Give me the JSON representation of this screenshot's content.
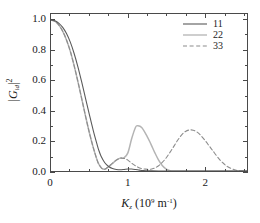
{
  "figure": {
    "background": "#ffffff",
    "frame_color": "#4a4a4a"
  },
  "axes": {
    "x_title_symbol": "K",
    "x_title_sub": "z",
    "x_title_unit_open": " (10",
    "x_title_unit_exp": "9",
    "x_title_unit_m": " m",
    "x_title_unit_mexp": "-1",
    "x_title_unit_close": ")",
    "y_title_bar_open": "|",
    "y_title_symbol": "G",
    "y_title_sub": "id",
    "y_title_bar_close": "|",
    "y_title_exp": "2",
    "x_ticklabels": [
      "0",
      "1",
      "2"
    ],
    "y_ticklabels": [
      "1.0",
      "0.8",
      "0.6",
      "0.4",
      "0.2",
      "0.0"
    ]
  },
  "legend": {
    "entries": [
      {
        "label": "11",
        "style": "solid",
        "color": "#5a5a5a",
        "width": 1.1
      },
      {
        "label": "22",
        "style": "solid",
        "color": "#b4b4b4",
        "width": 1.3
      },
      {
        "label": "33",
        "style": "dashed",
        "color": "#8c8c8c",
        "width": 1.1
      }
    ]
  },
  "chart_data": {
    "type": "line",
    "title": "",
    "xlabel": "K_z (10^9 m^-1)",
    "ylabel": "|G_id|^2",
    "xlim": [
      0,
      2.55
    ],
    "ylim": [
      0,
      1.04
    ],
    "xticks": [
      0,
      1,
      2
    ],
    "yticks": [
      0.0,
      0.2,
      0.4,
      0.6,
      0.8,
      1.0
    ],
    "x_minor_step": 0.25,
    "y_minor_step": 0.1,
    "grid": false,
    "legend_position": "top-right",
    "series": [
      {
        "name": "11",
        "style": "solid",
        "color": "#5a5a5a",
        "comment": "broad monotonic decay to zero near 0.62, then tiny sidelobe peaking ~0.015 at 0.82",
        "x": [
          0.0,
          0.05,
          0.1,
          0.15,
          0.2,
          0.25,
          0.3,
          0.35,
          0.4,
          0.45,
          0.5,
          0.55,
          0.6,
          0.62,
          0.65,
          0.7,
          0.75,
          0.8,
          0.85,
          0.9,
          0.95,
          1.0,
          1.05,
          1.1,
          1.15,
          1.2,
          1.3,
          1.4,
          1.6,
          1.8,
          2.0,
          2.2,
          2.4,
          2.55
        ],
        "y": [
          1.0,
          0.995,
          0.98,
          0.953,
          0.912,
          0.855,
          0.78,
          0.69,
          0.588,
          0.48,
          0.372,
          0.268,
          0.175,
          0.14,
          0.1,
          0.055,
          0.03,
          0.016,
          0.01,
          0.008,
          0.01,
          0.013,
          0.013,
          0.01,
          0.006,
          0.003,
          0.001,
          0.0,
          0.0,
          0.0,
          0.0,
          0.0,
          0.0,
          0.0
        ]
      },
      {
        "name": "22",
        "style": "solid",
        "color": "#b4b4b4",
        "comment": "fast decay to zero near 0.62, small lobe 0.085 at 0.90, main lobe 0.300 at 1.13, back to 0 at 1.55",
        "x": [
          0.0,
          0.05,
          0.1,
          0.15,
          0.2,
          0.25,
          0.3,
          0.35,
          0.4,
          0.45,
          0.5,
          0.55,
          0.6,
          0.62,
          0.66,
          0.7,
          0.75,
          0.8,
          0.85,
          0.9,
          0.95,
          1.0,
          1.05,
          1.1,
          1.13,
          1.18,
          1.25,
          1.3,
          1.35,
          1.4,
          1.45,
          1.5,
          1.55,
          1.6,
          1.7,
          1.8,
          2.0,
          2.2,
          2.4,
          2.55
        ],
        "y": [
          1.0,
          0.992,
          0.968,
          0.928,
          0.87,
          0.795,
          0.7,
          0.592,
          0.478,
          0.362,
          0.252,
          0.155,
          0.072,
          0.048,
          0.018,
          0.012,
          0.028,
          0.05,
          0.072,
          0.085,
          0.088,
          0.12,
          0.215,
          0.29,
          0.3,
          0.288,
          0.23,
          0.178,
          0.122,
          0.072,
          0.035,
          0.012,
          0.002,
          0.0,
          0.0,
          0.0,
          0.0,
          0.0,
          0.0,
          0.0
        ]
      },
      {
        "name": "33",
        "style": "dashed",
        "color": "#8c8c8c",
        "comment": "overlays 22 in initial decay, small lobe 0.085 at 0.92, dips near 1.28, broad lobe 0.272 at 1.80, to 0 near 2.45",
        "x": [
          0.0,
          0.05,
          0.1,
          0.15,
          0.2,
          0.25,
          0.3,
          0.35,
          0.4,
          0.45,
          0.5,
          0.55,
          0.6,
          0.62,
          0.66,
          0.7,
          0.75,
          0.8,
          0.85,
          0.9,
          0.92,
          0.96,
          1.0,
          1.05,
          1.1,
          1.18,
          1.25,
          1.3,
          1.35,
          1.4,
          1.45,
          1.5,
          1.55,
          1.6,
          1.65,
          1.7,
          1.75,
          1.8,
          1.85,
          1.9,
          1.95,
          2.0,
          2.05,
          2.1,
          2.2,
          2.3,
          2.4,
          2.45,
          2.55
        ],
        "y": [
          1.0,
          0.992,
          0.968,
          0.928,
          0.87,
          0.795,
          0.7,
          0.592,
          0.478,
          0.362,
          0.252,
          0.155,
          0.072,
          0.048,
          0.018,
          0.012,
          0.03,
          0.052,
          0.072,
          0.084,
          0.085,
          0.082,
          0.072,
          0.052,
          0.034,
          0.016,
          0.012,
          0.012,
          0.02,
          0.035,
          0.058,
          0.088,
          0.125,
          0.165,
          0.205,
          0.24,
          0.262,
          0.272,
          0.27,
          0.258,
          0.235,
          0.205,
          0.172,
          0.138,
          0.072,
          0.028,
          0.006,
          0.002,
          0.0
        ]
      }
    ]
  }
}
